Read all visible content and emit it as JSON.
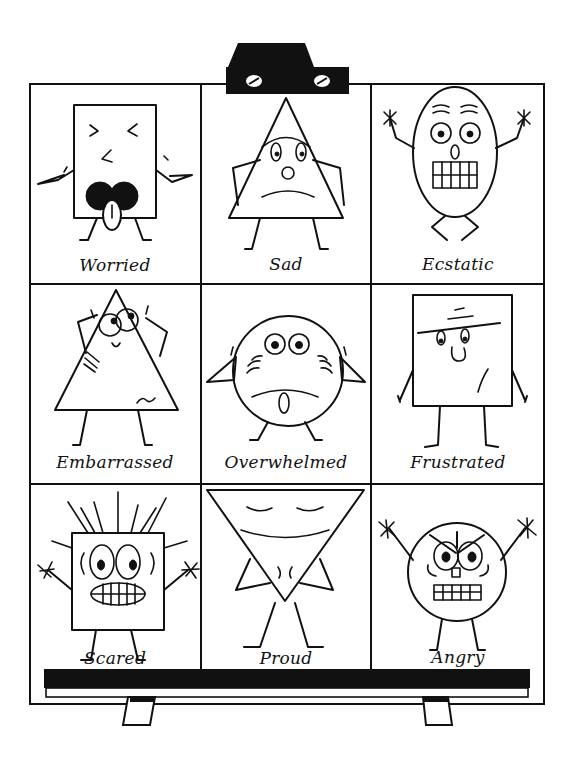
{
  "cells": [
    {
      "label": "Worried",
      "shape": "rectangle"
    },
    {
      "label": "Sad",
      "shape": "triangle"
    },
    {
      "label": "Ecstatic",
      "shape": "oval"
    },
    {
      "label": "Embarrassed",
      "shape": "triangle"
    },
    {
      "label": "Overwhelmed",
      "shape": "circle"
    },
    {
      "label": "Frustrated",
      "shape": "square"
    },
    {
      "label": "Scared",
      "shape": "square"
    },
    {
      "label": "Proud",
      "shape": "inverted-triangle"
    },
    {
      "label": "Angry",
      "shape": "circle"
    }
  ],
  "colors": {
    "ink": "#111111",
    "paper": "#ffffff"
  }
}
